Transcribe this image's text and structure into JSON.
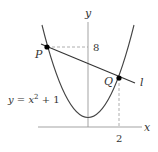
{
  "diagram": {
    "axes": {
      "x_label": "x",
      "y_label": "y"
    },
    "curve": {
      "equation_label": "y = x² + 1",
      "eq_lhs": "y = x",
      "eq_exp": "2",
      "eq_rhs": " + 1"
    },
    "line": {
      "label": "l"
    },
    "points": [
      {
        "name": "P",
        "x": -2.6458,
        "y": 8
      },
      {
        "name": "Q",
        "x": 2,
        "y": 5
      }
    ],
    "tick_labels": {
      "y_tick": "8",
      "x_tick": "2"
    },
    "colors": {
      "curve": "#444444",
      "line": "#333333",
      "axes": "#999999",
      "dashed": "#999999",
      "point": "#000000"
    }
  }
}
